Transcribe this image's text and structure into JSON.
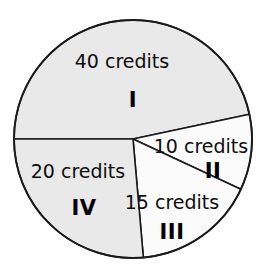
{
  "chart_data": {
    "type": "pie",
    "title": "",
    "subtitle": "",
    "xlabel": "",
    "ylabel": "",
    "unit": "credits",
    "legend_position": "none",
    "grid": false,
    "total": 85,
    "center": {
      "cx": 133,
      "cy": 139,
      "r": 119
    },
    "fills": {
      "shaded": "#e9e9e9",
      "plain": "#fbfbfb",
      "outline": "#1a1a1a",
      "background": "#ffffff"
    },
    "categories": [
      "I",
      "II",
      "III",
      "IV"
    ],
    "values": [
      40,
      10,
      15,
      20
    ],
    "slices": [
      {
        "id": "slice-1",
        "roman": "I",
        "value": 40,
        "value_label": "40 credits",
        "start_angle": 180,
        "end_angle": 348,
        "fill": "#e9e9e9",
        "value_label_x": 122,
        "value_label_y": 62,
        "roman_x": 133,
        "roman_y": 101
      },
      {
        "id": "slice-2",
        "roman": "II",
        "value": 10,
        "value_label": "10 credits",
        "start_angle": 348,
        "end_angle": 25,
        "fill": "#fbfbfb",
        "value_label_x": 201,
        "value_label_y": 147,
        "roman_x": 213,
        "roman_y": 172
      },
      {
        "id": "slice-3",
        "roman": "III",
        "value": 15,
        "value_label": "15 credits",
        "start_angle": 25,
        "end_angle": 85,
        "fill": "#fbfbfb",
        "value_label_x": 172,
        "value_label_y": 203,
        "roman_x": 172,
        "roman_y": 233
      },
      {
        "id": "slice-4",
        "roman": "IV",
        "value": 20,
        "value_label": "20 credits",
        "start_angle": 85,
        "end_angle": 180,
        "fill": "#e9e9e9",
        "value_label_x": 78,
        "value_label_y": 172,
        "roman_x": 84,
        "roman_y": 209
      }
    ]
  }
}
